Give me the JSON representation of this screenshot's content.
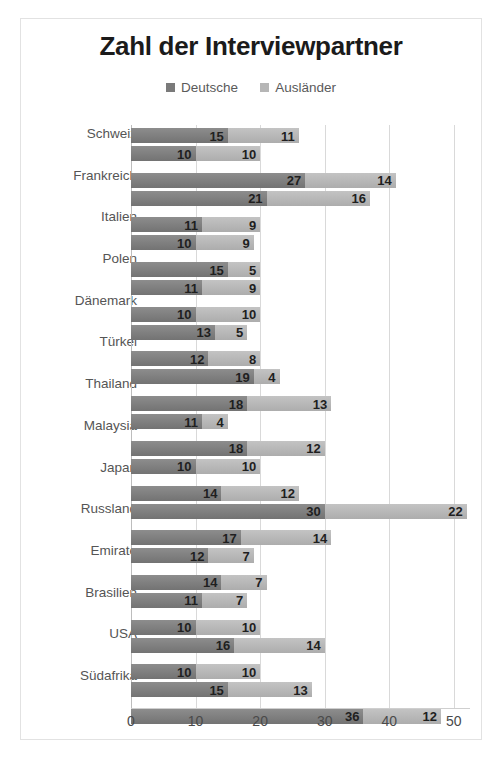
{
  "chart_data": {
    "type": "bar",
    "orientation": "horizontal",
    "stacked": true,
    "title": "Zahl der Interviewpartner",
    "xlabel": "",
    "ylabel": "",
    "xlim": [
      0,
      52.5
    ],
    "xticks": [
      0,
      10,
      20,
      30,
      40,
      50
    ],
    "grid": true,
    "legend_position": "top-center",
    "legend": [
      {
        "name": "Deutsche",
        "color": "#7a7a7a"
      },
      {
        "name": "Ausländer",
        "color": "#b6b6b6"
      }
    ],
    "categories": [
      "Schweiz",
      "",
      "Frankreich",
      "",
      "Italien",
      "",
      "Polen",
      "",
      "Dänemark",
      "",
      "Türkei",
      "",
      "Thailand",
      "",
      "Malaysia",
      "",
      "Japan",
      "",
      "Russland",
      "",
      "Emirate",
      "",
      "Brasilien",
      "",
      "USA",
      "",
      "Südafrika",
      ""
    ],
    "groups": [
      {
        "label": "Schweiz",
        "rows": [
          {
            "deutsche": 15,
            "auslaender": 11
          },
          {
            "deutsche": 10,
            "auslaender": 10
          }
        ]
      },
      {
        "label": "Frankreich",
        "rows": [
          {
            "deutsche": 27,
            "auslaender": 14
          },
          {
            "deutsche": 21,
            "auslaender": 16
          }
        ]
      },
      {
        "label": "Italien",
        "rows": [
          {
            "deutsche": 11,
            "auslaender": 9
          },
          {
            "deutsche": 10,
            "auslaender": 9
          }
        ]
      },
      {
        "label": "Polen",
        "rows": [
          {
            "deutsche": 15,
            "auslaender": 5
          },
          {
            "deutsche": 11,
            "auslaender": 9
          }
        ]
      },
      {
        "label": "Dänemark",
        "rows": [
          {
            "deutsche": 10,
            "auslaender": 10
          },
          {
            "deutsche": 13,
            "auslaender": 5
          }
        ]
      },
      {
        "label": "Türkei",
        "rows": [
          {
            "deutsche": 12,
            "auslaender": 8
          },
          {
            "deutsche": 19,
            "auslaender": 4
          }
        ]
      },
      {
        "label": "Thailand",
        "rows": [
          {
            "deutsche": 18,
            "auslaender": 13
          },
          {
            "deutsche": 11,
            "auslaender": 4
          }
        ]
      },
      {
        "label": "Malaysia",
        "rows": [
          {
            "deutsche": 18,
            "auslaender": 12
          },
          {
            "deutsche": 10,
            "auslaender": 10
          }
        ]
      },
      {
        "label": "Japan",
        "rows": [
          {
            "deutsche": 14,
            "auslaender": 12
          },
          {
            "deutsche": 30,
            "auslaender": 22
          }
        ]
      },
      {
        "label": "Russland",
        "rows": [
          {
            "deutsche": 17,
            "auslaender": 14
          },
          {
            "deutsche": 12,
            "auslaender": 7
          }
        ]
      },
      {
        "label": "Emirate",
        "rows": [
          {
            "deutsche": 14,
            "auslaender": 7
          },
          {
            "deutsche": 11,
            "auslaender": 7
          }
        ]
      },
      {
        "label": "Brasilien",
        "rows": [
          {
            "deutsche": 10,
            "auslaender": 10
          },
          {
            "deutsche": 16,
            "auslaender": 14
          }
        ]
      },
      {
        "label": "USA",
        "rows": [
          {
            "deutsche": 10,
            "auslaender": 10
          },
          {
            "deutsche": 15,
            "auslaender": 13
          }
        ]
      },
      {
        "label": "Südafrika",
        "rows": [
          {
            "deutsche": 36,
            "auslaender": 12
          },
          {
            "deutsche": 0,
            "auslaender": 0
          }
        ]
      }
    ]
  },
  "colors": {
    "deutsche": "#7a7a7a",
    "auslaender": "#b6b6b6",
    "grid": "#d9d9d9",
    "frame": "#e2e2e2",
    "title_text": "#1b1b1b",
    "axis_text": "#4a4a4a"
  }
}
